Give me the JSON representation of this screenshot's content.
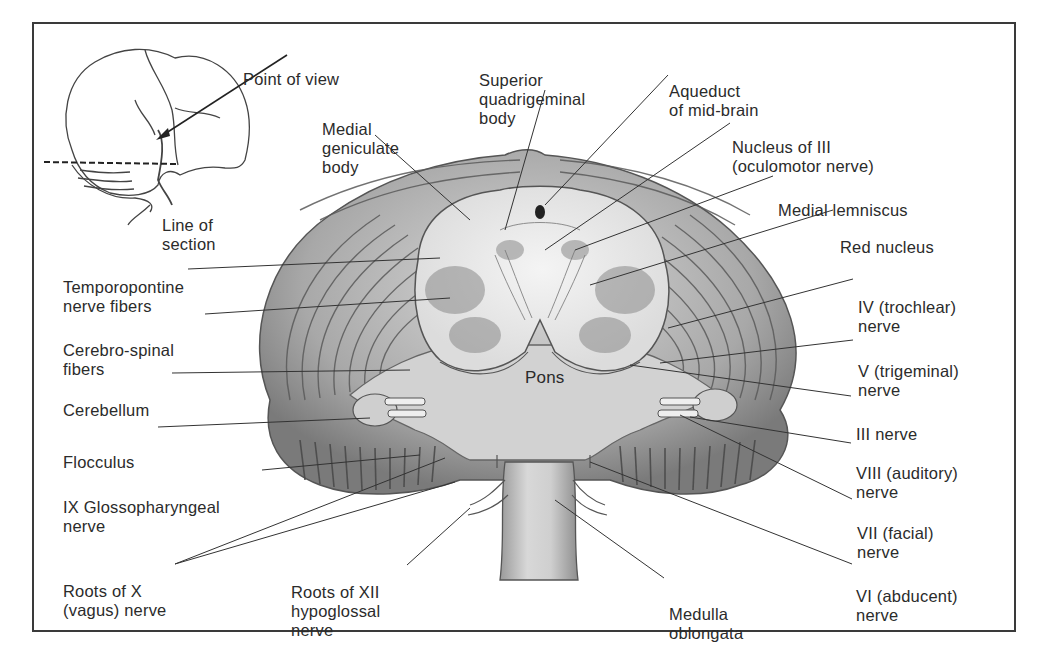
{
  "figure": {
    "colors": {
      "ink": "#2b2b2b",
      "frame": "#3a3a3a",
      "tissue_light": "#e9e9e9",
      "tissue_mid": "#b8b8b8",
      "tissue_dark": "#6a6a6a",
      "background": "#ffffff"
    }
  },
  "inset": {
    "point_of_view": "Point of view",
    "line_of_section": [
      "Line of",
      "section"
    ]
  },
  "labels": {
    "superior_quadrigeminal": [
      "Superior",
      "quadrigeminal",
      "body"
    ],
    "medial_geniculate": [
      "Medial",
      "geniculate",
      "body"
    ],
    "aqueduct": [
      "Aqueduct",
      "of mid-brain"
    ],
    "nucleus_iii": [
      "Nucleus of III",
      "(oculomotor nerve)"
    ],
    "medial_lemniscus": [
      "Medial lemniscus"
    ],
    "red_nucleus": [
      "Red nucleus"
    ],
    "temporopontine": [
      "Temporopontine",
      "nerve fibers"
    ],
    "cerebro_spinal": [
      "Cerebro-spinal",
      "fibers"
    ],
    "cerebellum": [
      "Cerebellum"
    ],
    "flocculus": [
      "Flocculus"
    ],
    "glossopharyngeal": [
      "IX Glossopharyngeal",
      "nerve"
    ],
    "vagus": [
      "Roots of X",
      "(vagus) nerve"
    ],
    "hypoglossal": [
      "Roots of XII",
      "hypoglossal",
      "nerve"
    ],
    "medulla": [
      "Medulla",
      "oblongata"
    ],
    "pons": "Pons",
    "trochlear": [
      "IV (trochlear)",
      "nerve"
    ],
    "trigeminal": [
      "V (trigeminal)",
      "nerve"
    ],
    "oculomotor": [
      "III nerve"
    ],
    "auditory": [
      "VIII (auditory)",
      "nerve"
    ],
    "facial": [
      "VII (facial)",
      "nerve"
    ],
    "abducent": [
      "VI (abducent)",
      "nerve"
    ]
  }
}
